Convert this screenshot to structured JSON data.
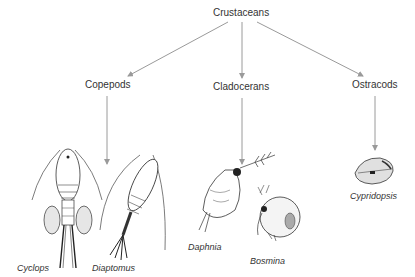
{
  "root": {
    "label": "Crustaceans"
  },
  "groups": [
    {
      "label": "Copepods",
      "species": [
        "Cyclops",
        "Diaptomus"
      ]
    },
    {
      "label": "Cladocerans",
      "species": [
        "Daphnia",
        "Bosmina"
      ]
    },
    {
      "label": "Ostracods",
      "species": [
        "Cypridopsis"
      ]
    }
  ],
  "colors": {
    "arrow": "#9a9a9a",
    "text": "#333333",
    "ink": "#222222"
  }
}
